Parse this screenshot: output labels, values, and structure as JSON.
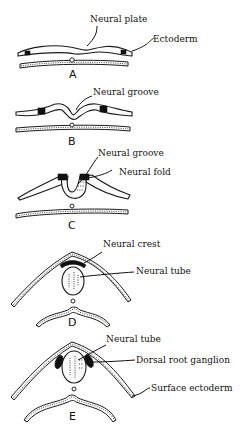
{
  "figure": {
    "stages": [
      {
        "id": "A",
        "label": "A",
        "annotations": [
          "Neural plate",
          "Ectoderm"
        ]
      },
      {
        "id": "B",
        "label": "B",
        "annotations": [
          "Neural groove"
        ]
      },
      {
        "id": "C",
        "label": "C",
        "annotations": [
          "Neural groove",
          "Neural fold"
        ]
      },
      {
        "id": "D",
        "label": "D",
        "annotations": [
          "Neural crest",
          "Neural tube"
        ]
      },
      {
        "id": "E",
        "label": "E",
        "annotations": [
          "Neural tube",
          "Dorsal root ganglion",
          "Surface ectoderm"
        ]
      }
    ]
  }
}
